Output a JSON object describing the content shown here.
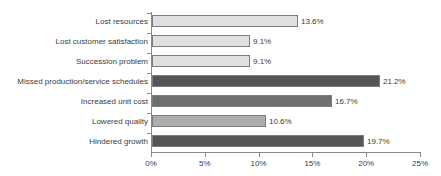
{
  "chart_data": {
    "type": "bar",
    "orientation": "horizontal",
    "title": "",
    "subtitle": "",
    "xlabel": "",
    "ylabel": "",
    "xlim": [
      0,
      25
    ],
    "xtick_labels": [
      "0%",
      "5%",
      "10%",
      "15%",
      "20%",
      "25%"
    ],
    "xtick_values": [
      0,
      5,
      10,
      15,
      20,
      25
    ],
    "grid": false,
    "legend": "none",
    "value_label_suffix": "%",
    "categories": [
      "Lost resources",
      "Lost customer satisfaction",
      "Succession problem",
      "Missed production/service schedules",
      "Increased unit cost",
      "Lowered quality",
      "Hindered growth"
    ],
    "values": [
      13.6,
      9.1,
      9.1,
      21.2,
      16.7,
      10.6,
      19.7
    ],
    "value_labels": [
      "13.6%",
      "9.1%",
      "9.1%",
      "21.2%",
      "16.7%",
      "10.6%",
      "19.7%"
    ],
    "bar_colors": [
      "#e0e0e0",
      "#e0e0e0",
      "#e0e0e0",
      "#555555",
      "#6e6e6e",
      "#adadad",
      "#555555"
    ],
    "bar_border_color": "#7d7d7d",
    "axis_color": "#8a8a8a",
    "text_color": "#3b3b3b",
    "background_color": "#ffffff",
    "bars": [
      {
        "category": "Lost resources",
        "value": 13.6,
        "label": "13.6%",
        "color": "#e0e0e0"
      },
      {
        "category": "Lost customer satisfaction",
        "value": 9.1,
        "label": "9.1%",
        "color": "#e0e0e0"
      },
      {
        "category": "Succession problem",
        "value": 9.1,
        "label": "9.1%",
        "color": "#e0e0e0"
      },
      {
        "category": "Missed production/service schedules",
        "value": 21.2,
        "label": "21.2%",
        "color": "#555555"
      },
      {
        "category": "Increased unit cost",
        "value": 16.7,
        "label": "16.7%",
        "color": "#6e6e6e"
      },
      {
        "category": "Lowered quality",
        "value": 10.6,
        "label": "10.6%",
        "color": "#adadad"
      },
      {
        "category": "Hindered growth",
        "value": 19.7,
        "label": "19.7%",
        "color": "#555555"
      }
    ]
  }
}
